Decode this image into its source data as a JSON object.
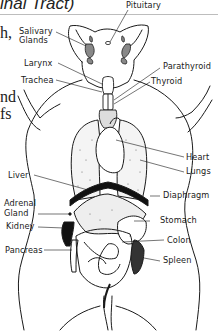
{
  "header": {
    "title_fragment": "inal Tract)"
  },
  "side_text_fragments": [
    "h,",
    "nd",
    "fs"
  ],
  "diagram": {
    "type": "anatomical-labeled-diagram",
    "labels": {
      "pituitary": "Pituitary",
      "salivary_glands_line1": "Salivary",
      "salivary_glands_line2": "Glands",
      "larynx": "Larynx",
      "trachea": "Trachea",
      "parathyroid": "Parathyroid",
      "thyroid": "Thyroid",
      "heart": "Heart",
      "lungs": "Lungs",
      "liver": "Liver",
      "diaphragm": "Diaphragm",
      "adrenal_gland_line1": "Adrenal",
      "adrenal_gland_line2": "Gland",
      "kidney": "Kidney",
      "stomach": "Stomach",
      "colon": "Colon",
      "pancreas": "Pancreas",
      "spleen": "Spleen"
    },
    "colors": {
      "ink": "#1a1a1a",
      "background": "#ffffff",
      "rule": "#bdbdbd"
    }
  }
}
